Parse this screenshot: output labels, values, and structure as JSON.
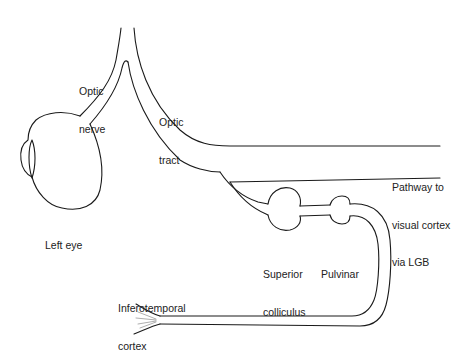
{
  "diagram": {
    "stroke_color": "#1a1a1a",
    "background": "#ffffff",
    "labels": {
      "optic_nerve": [
        "Optic",
        "nerve"
      ],
      "optic_tract": [
        "Optic",
        "tract"
      ],
      "left_eye": [
        "Left eye"
      ],
      "pathway": [
        "Pathway to",
        "visual cortex",
        "via LGB"
      ],
      "superior_colliculus": [
        "Superior",
        "colliculus"
      ],
      "pulvinar": [
        "Pulvinar"
      ],
      "inferotemporal": [
        "Inferotemporal",
        "cortex"
      ]
    }
  }
}
